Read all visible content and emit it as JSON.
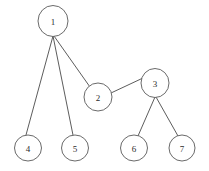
{
  "figure": {
    "background_color": "#ffffff",
    "node_stroke_color": "#595959",
    "node_fill_color": "#ffffff",
    "edge_color": "#4a4a4a",
    "label_color": "#2b2b2b"
  },
  "chart_data": {
    "type": "diagram",
    "subtype": "node-link-tree",
    "title": "",
    "directed": false,
    "node_labels": [
      "1",
      "2",
      "3",
      "4",
      "5",
      "6",
      "7"
    ],
    "nodes": [
      {
        "id": "1",
        "label": "1",
        "cx": 53,
        "cy": 21,
        "rx": 15,
        "ry": 15.5
      },
      {
        "id": "2",
        "label": "2",
        "cx": 98,
        "cy": 97,
        "rx": 14,
        "ry": 14
      },
      {
        "id": "3",
        "label": "3",
        "cx": 155,
        "cy": 83,
        "rx": 14,
        "ry": 14.5
      },
      {
        "id": "4",
        "label": "4",
        "cx": 28,
        "cy": 148,
        "rx": 13.5,
        "ry": 13
      },
      {
        "id": "5",
        "label": "5",
        "cx": 75,
        "cy": 148,
        "rx": 13.5,
        "ry": 13
      },
      {
        "id": "6",
        "label": "6",
        "cx": 134,
        "cy": 148,
        "rx": 13.5,
        "ry": 13
      },
      {
        "id": "7",
        "label": "7",
        "cx": 182,
        "cy": 148,
        "rx": 13,
        "ry": 13
      }
    ],
    "edges": [
      {
        "id": "edge-1-4",
        "source": "1",
        "target": "4",
        "x1": 53,
        "y1": 36,
        "x2": 26,
        "y2": 135
      },
      {
        "id": "edge-1-5",
        "source": "1",
        "target": "5",
        "x1": 53,
        "y1": 36,
        "x2": 73,
        "y2": 135
      },
      {
        "id": "edge-1-2",
        "source": "1",
        "target": "2",
        "x1": 54,
        "y1": 36,
        "x2": 90,
        "y2": 87
      },
      {
        "id": "edge-2-3",
        "source": "2",
        "target": "3",
        "x1": 111,
        "y1": 93,
        "x2": 143,
        "y2": 78
      },
      {
        "id": "edge-3-6",
        "source": "3",
        "target": "6",
        "x1": 155,
        "y1": 97,
        "x2": 138,
        "y2": 136
      },
      {
        "id": "edge-3-7",
        "source": "3",
        "target": "7",
        "x1": 156,
        "y1": 97,
        "x2": 178,
        "y2": 136
      }
    ],
    "adjacency": {
      "1": [
        "2",
        "4",
        "5"
      ],
      "2": [
        "1",
        "3"
      ],
      "3": [
        "2",
        "6",
        "7"
      ],
      "4": [
        "1"
      ],
      "5": [
        "1"
      ],
      "6": [
        "3"
      ],
      "7": [
        "3"
      ]
    },
    "node_count": 7,
    "edge_count": 6
  }
}
